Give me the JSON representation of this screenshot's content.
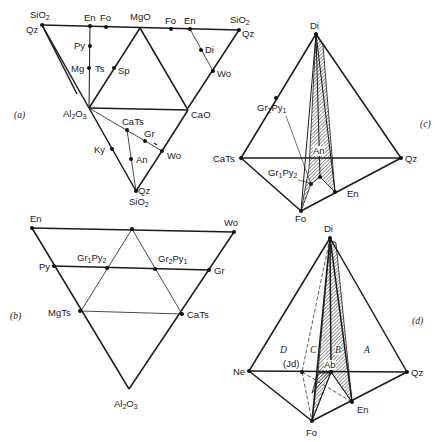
{
  "figure": {
    "panels": {
      "a": {
        "label": "(a)",
        "points": {
          "SiO2_tl": "SiO2",
          "Qz_tl": "Qz",
          "En_l": "En",
          "Fo_l": "Fo",
          "MgO": "MgO",
          "Fo_r": "Fo",
          "En_r": "En",
          "SiO2_tr": "SiO2",
          "Qz_tr": "Qz",
          "Py": "Py",
          "Mg": "Mg",
          "Ts": "Ts",
          "Sp": "Sp",
          "Di": "Di",
          "Wo_r": "Wo",
          "Al2O3": "Al2O3",
          "CaO": "CaO",
          "CaTs": "CaTs",
          "Gr": "Gr",
          "Ky": "Ky",
          "An": "An",
          "Wo_b": "Wo",
          "Qz_b": "Qz",
          "SiO2_b": "SiO2"
        }
      },
      "b": {
        "label": "(b)",
        "points": {
          "En": "En",
          "Wo": "Wo",
          "Py": "Py",
          "Gr1Py2": "Gr1Py2",
          "Gr2Py1": "Gr2Py1",
          "Gr": "Gr",
          "MgTs": "MgTs",
          "CaTs": "CaTs",
          "Al2O3": "Al2O3"
        }
      },
      "c": {
        "label": "(c)",
        "points": {
          "Di": "Di",
          "Gr2Py1": "Gr2Py1",
          "CaTs": "CaTs",
          "An": "An",
          "Qz": "Qz",
          "Gr1Py2": "Gr1Py2",
          "Fo": "Fo",
          "En": "En"
        }
      },
      "d": {
        "label": "(d)",
        "points": {
          "Di": "Di",
          "Ne": "Ne",
          "Jd": "(Jd)",
          "Ab": "Ab",
          "Qz": "Qz",
          "Fo": "Fo",
          "En": "En"
        },
        "regions": {
          "A": "A",
          "B": "B",
          "C": "C",
          "D": "D"
        }
      }
    },
    "colors": {
      "line": "#1a1a1a",
      "thin": "#3a3a3a",
      "background": "#ffffff"
    }
  }
}
